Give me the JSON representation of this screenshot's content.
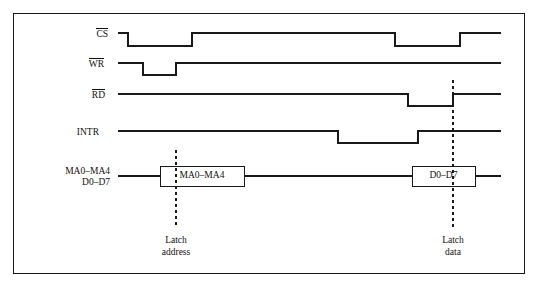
{
  "figure": {
    "kind": "timing-diagram",
    "frame": {
      "x": 13,
      "y": 13,
      "width": 512,
      "height": 261,
      "border_color": "#1a1a1a"
    },
    "line_color": "#1a1a1a",
    "background": "#ffffff"
  },
  "signals": [
    {
      "id": "cs",
      "label": "CS",
      "overline": true,
      "label_x": 108,
      "label_y": 28,
      "high_y": 33,
      "low_y": 46,
      "start_x": 118,
      "end_x": 501,
      "transitions": [
        {
          "x": 128,
          "to": "low"
        },
        {
          "x": 192,
          "to": "high"
        },
        {
          "x": 395,
          "to": "low"
        },
        {
          "x": 460,
          "to": "high"
        }
      ]
    },
    {
      "id": "wr",
      "label": "WR",
      "overline": true,
      "label_x": 104,
      "label_y": 58,
      "high_y": 63,
      "low_y": 75,
      "start_x": 118,
      "end_x": 501,
      "transitions": [
        {
          "x": 143,
          "to": "low"
        },
        {
          "x": 176,
          "to": "high"
        }
      ]
    },
    {
      "id": "rd",
      "label": "RD",
      "overline": true,
      "label_x": 105,
      "label_y": 89,
      "high_y": 94,
      "low_y": 106,
      "start_x": 118,
      "end_x": 501,
      "transitions": [
        {
          "x": 408,
          "to": "low"
        },
        {
          "x": 453,
          "to": "high"
        }
      ]
    },
    {
      "id": "intr",
      "label": "INTR",
      "overline": false,
      "label_x": 99,
      "label_y": 127,
      "high_y": 131,
      "low_y": 143,
      "start_x": 118,
      "end_x": 501,
      "transitions": [
        {
          "x": 338,
          "to": "low"
        },
        {
          "x": 418,
          "to": "high"
        }
      ]
    }
  ],
  "bus": {
    "id": "bus",
    "label_line1": "MA0–MA4",
    "label_line2": "D0–D7",
    "label_x": 42,
    "label_y": 166,
    "label_width": 68,
    "center_y": 176,
    "start_x": 118,
    "end_x": 501,
    "boxes": [
      {
        "id": "box-address",
        "text": "MA0–MA4",
        "x": 160,
        "y": 166,
        "width": 84,
        "height": 20
      },
      {
        "id": "box-data",
        "text": "D0–D7",
        "x": 412,
        "y": 166,
        "width": 63,
        "height": 20
      }
    ]
  },
  "markers": [
    {
      "id": "latch-address",
      "x": 176,
      "y_top": 150,
      "y_bottom": 228,
      "caption_line1": "Latch",
      "caption_line2": "address",
      "caption_y": 234
    },
    {
      "id": "latch-data",
      "x": 453,
      "y_top": 80,
      "y_bottom": 228,
      "caption_line1": "Latch",
      "caption_line2": "data",
      "caption_y": 234
    }
  ]
}
